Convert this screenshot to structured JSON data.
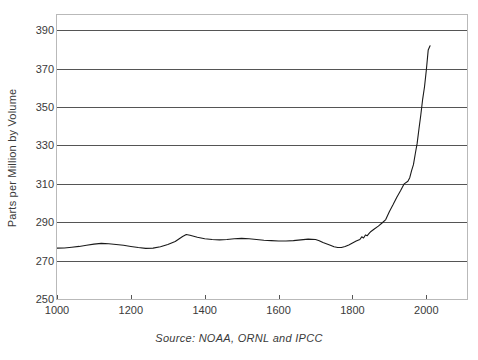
{
  "chart_data": {
    "type": "line",
    "title": "",
    "subtitle": "",
    "xlabel": "",
    "ylabel": "Parts per Million by Volume",
    "source_note": "Source: NOAA, ORNL and IPCC",
    "xlim": [
      1000,
      2110
    ],
    "ylim": [
      250,
      398
    ],
    "grid": "horizontal",
    "legend": "none",
    "x_ticks": [
      1000,
      1200,
      1400,
      1600,
      1800,
      2000
    ],
    "x_tick_labels": [
      "1000",
      "1200",
      "1400",
      "1600",
      "1800",
      "2000"
    ],
    "y_ticks": [
      250,
      270,
      290,
      310,
      330,
      350,
      370,
      390
    ],
    "y_tick_labels": [
      "250",
      "270",
      "290",
      "310",
      "330",
      "350",
      "370",
      "390"
    ],
    "series": [
      {
        "name": "Atmospheric CO2 concentration",
        "color": "#1a1a1a",
        "x": [
          1000,
          1020,
          1040,
          1060,
          1080,
          1100,
          1120,
          1140,
          1160,
          1180,
          1200,
          1220,
          1240,
          1260,
          1280,
          1300,
          1320,
          1340,
          1350,
          1360,
          1380,
          1400,
          1420,
          1440,
          1460,
          1480,
          1500,
          1520,
          1540,
          1560,
          1580,
          1600,
          1620,
          1640,
          1660,
          1680,
          1700,
          1710,
          1720,
          1740,
          1750,
          1760,
          1770,
          1780,
          1790,
          1800,
          1810,
          1820,
          1825,
          1830,
          1835,
          1840,
          1845,
          1850,
          1860,
          1870,
          1880,
          1890,
          1900,
          1910,
          1920,
          1930,
          1940,
          1950,
          1955,
          1960,
          1965,
          1970,
          1975,
          1980,
          1985,
          1990,
          1995,
          2000,
          2005,
          2010
        ],
        "y": [
          276.5,
          276.6,
          277.0,
          277.4,
          278.0,
          278.6,
          279.0,
          278.8,
          278.4,
          278.0,
          277.4,
          276.8,
          276.4,
          276.5,
          277.2,
          278.4,
          280.0,
          282.6,
          283.6,
          283.2,
          282.2,
          281.4,
          281.0,
          280.8,
          281.0,
          281.4,
          281.6,
          281.4,
          281.0,
          280.6,
          280.4,
          280.2,
          280.2,
          280.4,
          280.8,
          281.2,
          281.0,
          280.4,
          279.4,
          278.0,
          277.2,
          276.8,
          276.8,
          277.4,
          278.2,
          279.2,
          280.2,
          281.0,
          282.4,
          281.8,
          283.4,
          283.0,
          284.2,
          285.2,
          286.6,
          288.0,
          289.6,
          291.4,
          295.6,
          299.2,
          303.0,
          306.4,
          310.0,
          311.4,
          313.2,
          316.9,
          320.0,
          325.7,
          331.1,
          338.7,
          346.0,
          354.2,
          360.6,
          369.5,
          379.8,
          382.0
        ]
      }
    ],
    "annotations": []
  }
}
